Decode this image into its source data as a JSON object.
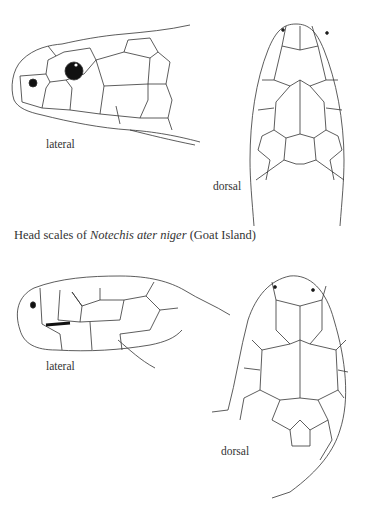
{
  "figure_top": {
    "subject": "Notechis ater niger",
    "lateral_label": "lateral",
    "dorsal_label": "dorsal",
    "caption": {
      "prefix": "Head scales of ",
      "species_italic": "Notechis ater niger",
      "suffix": " (Goat Island)"
    }
  },
  "figure_bottom": {
    "lateral_label": "lateral",
    "dorsal_label": "dorsal"
  },
  "colors": {
    "ink": "#2a2a2a",
    "background": "#ffffff"
  }
}
